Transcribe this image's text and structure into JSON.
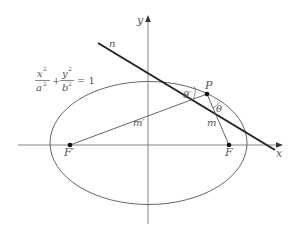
{
  "diagram": {
    "equation": {
      "x_num": "x",
      "x_exp": "2",
      "x_den": "a",
      "x_den_exp": "2",
      "plus": "+",
      "y_num": "y",
      "y_exp": "2",
      "y_den": "b",
      "y_den_exp": "2",
      "equals": "= 1"
    },
    "axes": {
      "x_label": "x",
      "y_label": "y"
    },
    "labels": {
      "normal": "n",
      "point": "P",
      "focus_right": "F",
      "focus_left": "F′",
      "segment_right": "m",
      "segment_left": "m′",
      "angle_right": "θ",
      "angle_left": "θ′"
    },
    "geometry": {
      "ellipse": {
        "cx": 148.5,
        "cy": 143,
        "rx": 98.5,
        "ry": 61.5
      },
      "point_P": [
        207,
        94
      ],
      "focus_F": [
        229,
        145
      ],
      "focus_F_prime": [
        70,
        145
      ],
      "tangent_line": [
        [
          98,
          43
        ],
        [
          275,
          150
        ]
      ],
      "colors": {
        "thin": "#555555",
        "thick": "#222222"
      }
    }
  }
}
